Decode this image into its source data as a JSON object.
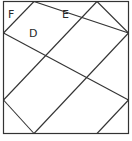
{
  "diagram": {
    "type": "grid-of-diamonds",
    "stroke_color": "#333333",
    "labels": [
      {
        "id": "F",
        "text": "F"
      },
      {
        "id": "E",
        "text": "E"
      },
      {
        "id": "D",
        "text": "D"
      }
    ]
  }
}
